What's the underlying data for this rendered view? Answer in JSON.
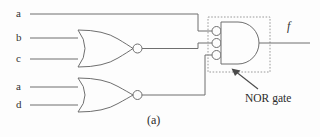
{
  "figure": {
    "caption": "(a)",
    "annotation": "NOR gate",
    "output_label": "f"
  },
  "inputs": [
    {
      "name": "a",
      "label": "a",
      "y": 14
    },
    {
      "name": "b",
      "label": "b",
      "y": 38
    },
    {
      "name": "c",
      "label": "c",
      "y": 59
    },
    {
      "name": "a2",
      "label": "a",
      "y": 87
    },
    {
      "name": "d",
      "label": "d",
      "y": 105
    }
  ],
  "gates": [
    {
      "name": "nor-gate-1",
      "type": "NOR",
      "inputs": [
        "b",
        "c"
      ]
    },
    {
      "name": "nor-gate-2",
      "type": "NOR",
      "inputs": [
        "a",
        "d"
      ]
    },
    {
      "name": "negative-and-gate",
      "type": "AND-with-inverted-inputs",
      "inputs": [
        "a",
        "nor-gate-1",
        "nor-gate-2"
      ],
      "bubbles": 3
    }
  ],
  "output": {
    "name": "f",
    "label": "f"
  },
  "colors": {
    "line": "#6f6f6f",
    "text": "#2b2b2b",
    "dotted": "#9a9a9a",
    "arrow": "#4a4a4a",
    "background": "#fdfdfd"
  }
}
